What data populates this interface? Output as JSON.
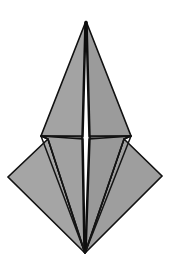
{
  "figure": {
    "canvas": {
      "width": 174,
      "height": 271,
      "background": "#ffffff"
    },
    "colors": {
      "fill_upper": "#a3a3a3",
      "fill_upper_right": "#9b9b9b",
      "fill_wing_left": "#a5a5a5",
      "fill_wing_right": "#9e9e9e",
      "fill_inner_left": "#a1a1a1",
      "fill_inner_right": "#999999",
      "stroke": "#111111",
      "background": "#ffffff"
    },
    "vertices": {
      "apex": [
        86,
        21
      ],
      "bottom": [
        85,
        253
      ],
      "base_left": [
        41,
        136
      ],
      "base_right": [
        131,
        136
      ],
      "wing_left_tip": [
        8,
        177
      ],
      "wing_right_tip": [
        162,
        176
      ],
      "fold_left": [
        48,
        139
      ],
      "fold_right": [
        124,
        139
      ],
      "ridge_left_top": [
        83,
        24
      ],
      "ridge_right_top": [
        89,
        24
      ],
      "ridge_left_bottom": [
        82,
        250
      ],
      "ridge_right_bottom": [
        88,
        250
      ]
    },
    "facets": [
      {
        "name": "upper-left-face",
        "points": "86,21 83,136 41,136",
        "fill": "#a3a3a3"
      },
      {
        "name": "upper-right-face",
        "points": "86,21 131,136 89,136",
        "fill": "#9b9b9b"
      },
      {
        "name": "lower-left-outer-wing",
        "points": "48,139 8,177 85,253",
        "fill": "#a5a5a5"
      },
      {
        "name": "lower-right-outer-wing",
        "points": "124,139 162,176 85,253",
        "fill": "#9e9e9e"
      },
      {
        "name": "lower-left-inner-face",
        "points": "41,136 48,139 85,253 83,139",
        "fill": "#a1a1a1"
      },
      {
        "name": "lower-right-inner-face",
        "points": "131,136 124,139 85,253 89,139",
        "fill": "#999999"
      }
    ],
    "creases": [
      {
        "name": "horizontal-base-left",
        "d": "M 41,136 L 83,137"
      },
      {
        "name": "horizontal-base-right",
        "d": "M 89,137 L 131,136"
      },
      {
        "name": "ridge-left",
        "d": "M 85,22 L 82,138 L 84,252"
      },
      {
        "name": "ridge-right",
        "d": "M 87,22 L 90,138 L 86,252"
      },
      {
        "name": "fold-left-diagonal",
        "d": "M 48,139 L 85,253"
      },
      {
        "name": "fold-right-diagonal",
        "d": "M 124,139 L 85,253"
      },
      {
        "name": "base-left-to-bottom",
        "d": "M 41,136 L 85,253"
      },
      {
        "name": "base-right-to-bottom",
        "d": "M 131,136 L 85,253"
      },
      {
        "name": "wing-left-upper-edge",
        "d": "M 41,136 L 48,139"
      },
      {
        "name": "wing-right-upper-edge",
        "d": "M 131,136 L 124,139"
      }
    ]
  }
}
